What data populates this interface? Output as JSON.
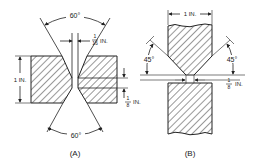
{
  "figure_a": {
    "caption": "(A)",
    "top_angle": "60°",
    "bottom_angle": "60°",
    "root_gap_num": "1",
    "root_gap_den": "16",
    "root_gap_unit": "IN.",
    "thickness": "1 IN.",
    "root_face_num": "1",
    "root_face_den": "8",
    "root_face_unit": "IN."
  },
  "figure_b": {
    "caption": "(B)",
    "width": "1 IN.",
    "left_angle": "45°",
    "right_angle": "45°",
    "gap_num": "1",
    "gap_den": "8",
    "gap_unit": "IN."
  },
  "colors": {
    "line": "#222222",
    "hatch": "#333333",
    "background": "#ffffff"
  }
}
